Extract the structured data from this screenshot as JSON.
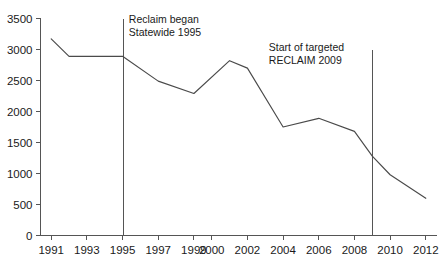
{
  "chart_data": {
    "type": "line",
    "title": "",
    "subtitle": "",
    "xlabel": "",
    "ylabel": "",
    "xlim": [
      1990.4,
      2012.6
    ],
    "ylim": [
      0,
      3500
    ],
    "grid": false,
    "legend": null,
    "legend_position": "none",
    "x_tick_labels": [
      "1991",
      "1993",
      "1995",
      "1997",
      "1999",
      "2000",
      "2002",
      "2004",
      "2006",
      "2008",
      "2010",
      "2012"
    ],
    "x_tick_values": [
      1991,
      1993,
      1995,
      1997,
      1999,
      2000,
      2002,
      2004,
      2006,
      2008,
      2010,
      2012
    ],
    "y_tick_labels": [
      "0",
      "500",
      "1000",
      "1500",
      "2000",
      "2500",
      "3000",
      "3500"
    ],
    "y_tick_values": [
      0,
      500,
      1000,
      1500,
      2000,
      2500,
      3000,
      3500
    ],
    "series": [
      {
        "name": "",
        "color": "#4a4a4a",
        "x": [
          1991,
          1992,
          1993,
          1995,
          1997,
          1999,
          2001,
          2002,
          2004,
          2006,
          2008,
          2009,
          2010,
          2012
        ],
        "values": [
          3170,
          2890,
          2890,
          2890,
          2490,
          2290,
          2820,
          2700,
          1750,
          1890,
          1680,
          1280,
          980,
          600
        ]
      }
    ],
    "annotations": [
      {
        "name": "reclaim-statewide-1995",
        "lines": [
          "Reclaim began",
          "Statewide 1995"
        ],
        "marker_x": 1995,
        "marker_y_top": 3500,
        "marker_y_bottom": 0,
        "text_x": 1995.35,
        "text_y": 3430
      },
      {
        "name": "targeted-reclaim-2009",
        "lines": [
          "Start of targeted",
          "RECLAIM 2009"
        ],
        "marker_x": 2009,
        "marker_y_top": 3000,
        "marker_y_bottom": 0,
        "text_x": 2003.2,
        "text_y": 2980
      }
    ]
  },
  "axis_color": "#555555"
}
